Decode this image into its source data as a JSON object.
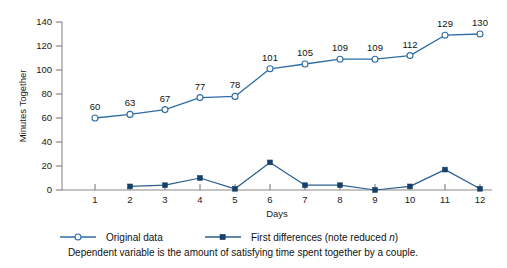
{
  "chart_data": {
    "type": "line",
    "title": "",
    "xlabel": "Days",
    "ylabel": "Minutes Together",
    "x": [
      1,
      2,
      3,
      4,
      5,
      6,
      7,
      8,
      9,
      10,
      11,
      12
    ],
    "xticklabels": [
      "1",
      "2",
      "3",
      "4",
      "5",
      "6",
      "7",
      "8",
      "9",
      "10",
      "11",
      "12"
    ],
    "yticklabels": [
      "0",
      "20",
      "40",
      "60",
      "80",
      "100",
      "120",
      "140"
    ],
    "yticks": [
      0,
      20,
      40,
      60,
      80,
      100,
      120,
      140
    ],
    "ylim": [
      0,
      140
    ],
    "xlim": [
      0.4,
      12.6
    ],
    "grid": false,
    "legend_position": "below-axes",
    "series": [
      {
        "name": "Original data",
        "marker": "open-circle",
        "color": "#2e6ca4",
        "x": [
          1,
          2,
          3,
          4,
          5,
          6,
          7,
          8,
          9,
          10,
          11,
          12
        ],
        "values": [
          60,
          63,
          67,
          77,
          78,
          101,
          105,
          109,
          109,
          112,
          129,
          130
        ],
        "data_labels": [
          "60",
          "63",
          "67",
          "77",
          "78",
          "101",
          "105",
          "109",
          "109",
          "112",
          "129",
          "130"
        ]
      },
      {
        "name": "First differences (note reduced n)",
        "marker": "filled-square",
        "color": "#2b5f8e",
        "x": [
          2,
          3,
          4,
          5,
          6,
          7,
          8,
          9,
          10,
          11,
          12
        ],
        "values": [
          3,
          4,
          10,
          1,
          23,
          4,
          4,
          0,
          3,
          17,
          1
        ],
        "data_labels": []
      }
    ],
    "annotations": [
      "Dependent variable is the amount of satisfying time spent together by a couple."
    ]
  },
  "legend": {
    "items": [
      {
        "label": "Original data",
        "label_italic_suffix": ""
      },
      {
        "label": "First differences (note reduced ",
        "label_italic_suffix": "n",
        "label_tail": ")"
      }
    ]
  },
  "caption": {
    "text": "Dependent variable is the amount of satisfying time spent together by a couple."
  },
  "axes": {
    "y_title": "Minutes Together",
    "x_title": "Days"
  },
  "colors": {
    "series_original": "#2e6ca4",
    "series_difference": "#2b5f8e",
    "axis": "#8a8a8a",
    "background": "#ffffff"
  }
}
